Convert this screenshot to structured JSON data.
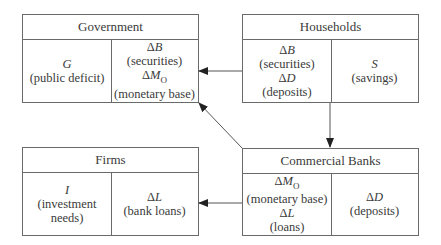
{
  "diagram": {
    "government": {
      "title": "Government",
      "left": [
        {
          "sym": "G",
          "label": "(public deficit)"
        }
      ],
      "right": [
        {
          "delta": "Δ",
          "sym": "B",
          "sub": "",
          "label": "(securities)"
        },
        {
          "delta": "Δ",
          "sym": "M",
          "sub": "O",
          "label": "(monetary base)"
        }
      ]
    },
    "households": {
      "title": "Households",
      "left": [
        {
          "delta": "Δ",
          "sym": "B",
          "sub": "",
          "label": "(securities)"
        },
        {
          "delta": "Δ",
          "sym": "D",
          "sub": "",
          "label": "(deposits)"
        }
      ],
      "right": [
        {
          "sym": "S",
          "label": "(savings)"
        }
      ]
    },
    "firms": {
      "title": "Firms",
      "left": [
        {
          "sym": "I",
          "label1": "(investment",
          "label2": "needs)"
        }
      ],
      "right": [
        {
          "delta": "Δ",
          "sym": "L",
          "label": "(bank loans)"
        }
      ]
    },
    "banks": {
      "title": "Commercial Banks",
      "left": [
        {
          "delta": "Δ",
          "sym": "M",
          "sub": "O",
          "label": "(monetary base)"
        },
        {
          "delta": "Δ",
          "sym": "L",
          "sub": "",
          "label": "(loans)"
        }
      ],
      "right": [
        {
          "delta": "Δ",
          "sym": "D",
          "label": "(deposits)"
        }
      ]
    },
    "arrows": [
      {
        "from": "households",
        "to": "government"
      },
      {
        "from": "households",
        "to": "banks"
      },
      {
        "from": "banks",
        "to": "government"
      },
      {
        "from": "banks",
        "to": "firms"
      }
    ]
  }
}
